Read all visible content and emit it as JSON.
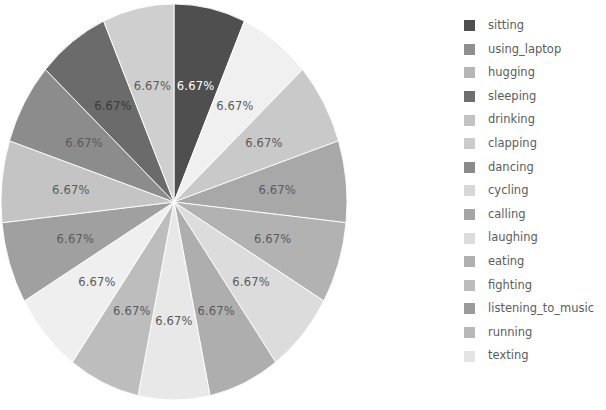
{
  "chart_data": {
    "type": "pie",
    "title": "",
    "categories": [
      "sitting",
      "using_laptop",
      "hugging",
      "sleeping",
      "drinking",
      "clapping",
      "dancing",
      "cycling",
      "calling",
      "laughing",
      "eating",
      "fighting",
      "listening_to_music",
      "running",
      "texting"
    ],
    "values": [
      6.67,
      6.67,
      6.67,
      6.67,
      6.67,
      6.67,
      6.67,
      6.67,
      6.67,
      6.67,
      6.67,
      6.67,
      6.67,
      6.67,
      6.67
    ],
    "value_labels": [
      "6.67%",
      "6.67%",
      "6.67%",
      "6.67%",
      "6.67%",
      "6.67%",
      "6.67%",
      "6.67%",
      "6.67%",
      "6.67%",
      "6.67%",
      "6.67%",
      "6.67%",
      "6.67%",
      "6.67%"
    ],
    "units": "percent",
    "total": 100,
    "slice_colors": [
      "#4f4f4f",
      "#f0f0f0",
      "#c9c9c9",
      "#a8a8a8",
      "#b2b2b2",
      "#dcdcdc",
      "#aeaeae",
      "#e8e8e8",
      "#bdbdbd",
      "#efefef",
      "#a0a0a0",
      "#c4c4c4",
      "#8c8c8c",
      "#6b6b6b",
      "#cfcfcf"
    ],
    "label_text_colors": [
      "#ffffff",
      "#5a5a5a",
      "#5a5a5a",
      "#5a5a5a",
      "#5a5a5a",
      "#5a5a5a",
      "#5a5a5a",
      "#5a5a5a",
      "#5a5a5a",
      "#5a5a5a",
      "#5a5a5a",
      "#5a5a5a",
      "#5a5a5a",
      "#3a3a3a",
      "#5a5a5a"
    ],
    "start_angle_deg": 90,
    "direction": "clockwise",
    "label_radius_fraction": 0.6,
    "xlabel": "",
    "ylabel": "",
    "grid": false,
    "legend": {
      "position": "right",
      "entries": [
        {
          "label": "sitting",
          "color": "#4f4f4f"
        },
        {
          "label": "using_laptop",
          "color": "#8f8f8f"
        },
        {
          "label": "hugging",
          "color": "#b6b6b6"
        },
        {
          "label": "sleeping",
          "color": "#6f6f6f"
        },
        {
          "label": "drinking",
          "color": "#c2c2c2"
        },
        {
          "label": "clapping",
          "color": "#cbcbcb"
        },
        {
          "label": "dancing",
          "color": "#8a8a8a"
        },
        {
          "label": "cycling",
          "color": "#d7d7d7"
        },
        {
          "label": "calling",
          "color": "#a5a5a5"
        },
        {
          "label": "laughing",
          "color": "#dcdcdc"
        },
        {
          "label": "eating",
          "color": "#b0b0b0"
        },
        {
          "label": "fighting",
          "color": "#bcbcbc"
        },
        {
          "label": "listening_to_music",
          "color": "#9b9b9b"
        },
        {
          "label": "running",
          "color": "#b8b8b8"
        },
        {
          "label": "texting",
          "color": "#e4e4e4"
        }
      ]
    },
    "geometry": {
      "center_x": 174,
      "center_y": 200,
      "radius_x": 173,
      "radius_y": 198
    }
  }
}
